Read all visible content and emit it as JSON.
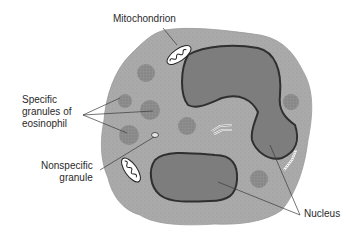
{
  "diagram": {
    "colors": {
      "background": "#ffffff",
      "cytoplasm": "#a9a9a9",
      "cell_edge": "#8f8f8f",
      "nucleus_fill": "#7e7e7e",
      "nucleus_outline": "#333333",
      "granule": "#8a8a8a",
      "line": "#3a3a3a",
      "mitochondrion_fill": "#ffffff"
    },
    "labels": {
      "mitochondrion": "Mitochondrion",
      "specific_granules": "Specific\ngranules of\neosinophil",
      "nonspecific_granule": "Nonspecific\ngranule",
      "nucleus": "Nucleus"
    }
  }
}
